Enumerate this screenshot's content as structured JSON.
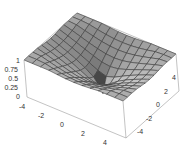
{
  "chart_data": {
    "type": "surface3d",
    "title": "",
    "xlabel": "",
    "ylabel": "",
    "zlabel": "",
    "x_range": [
      -5,
      5
    ],
    "y_range": [
      -5,
      5
    ],
    "z_range": [
      0,
      1
    ],
    "x_ticks": [
      "-4",
      "-2",
      "0",
      "2",
      "4"
    ],
    "y_ticks": [
      "4",
      "2",
      "0",
      "-2",
      "-4"
    ],
    "z_ticks": [
      "1",
      "0.75",
      "0.5",
      "0.25",
      "0"
    ],
    "grid_lines": 12,
    "surface_color": "#a8a8a8",
    "mesh_color": "#3a3a3a",
    "box_color": "#888888"
  }
}
